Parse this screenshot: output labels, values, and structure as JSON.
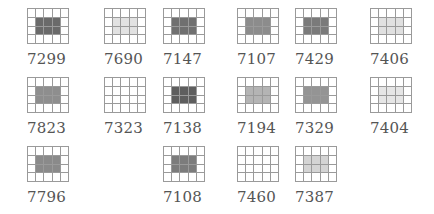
{
  "grid": {
    "cols": 5,
    "rows": 4,
    "shaded_cols": [
      1,
      2,
      3
    ],
    "shaded_rows": [
      1,
      2
    ]
  },
  "tiles": [
    {
      "label": "7299",
      "x": 27,
      "y": 8,
      "shade": "#6a6a6a"
    },
    {
      "label": "7690",
      "x": 104,
      "y": 8,
      "shade": "#e2e2e2"
    },
    {
      "label": "7147",
      "x": 163,
      "y": 8,
      "shade": "#707070"
    },
    {
      "label": "7107",
      "x": 237,
      "y": 8,
      "shade": "#8c8c8c"
    },
    {
      "label": "7429",
      "x": 295,
      "y": 8,
      "shade": "#7a7a7a"
    },
    {
      "label": "7406",
      "x": 370,
      "y": 8,
      "shade": "#e0e0e0"
    },
    {
      "label": "7823",
      "x": 27,
      "y": 77,
      "shade": "#8e8e8e"
    },
    {
      "label": "7323",
      "x": 104,
      "y": 77,
      "shade": "#ffffff"
    },
    {
      "label": "7138",
      "x": 163,
      "y": 77,
      "shade": "#5e5e5e"
    },
    {
      "label": "7194",
      "x": 237,
      "y": 77,
      "shade": "#b4b4b4"
    },
    {
      "label": "7329",
      "x": 295,
      "y": 77,
      "shade": "#949494"
    },
    {
      "label": "7404",
      "x": 370,
      "y": 77,
      "shade": "#e6e6e6"
    },
    {
      "label": "7796",
      "x": 27,
      "y": 146,
      "shade": "#8a8a8a"
    },
    {
      "label": "7108",
      "x": 163,
      "y": 146,
      "shade": "#7c7c7c"
    },
    {
      "label": "7460",
      "x": 237,
      "y": 146,
      "shade": "#ffffff"
    },
    {
      "label": "7387",
      "x": 295,
      "y": 146,
      "shade": "#d4d4d4"
    }
  ]
}
